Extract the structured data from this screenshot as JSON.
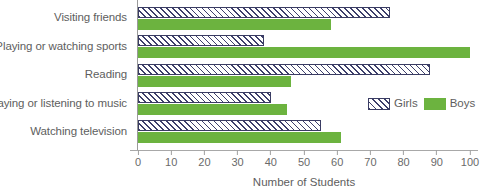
{
  "chart_data": {
    "type": "bar",
    "orientation": "horizontal",
    "title": "",
    "xlabel": "Number of Students",
    "ylabel": "",
    "xlim": [
      0,
      100
    ],
    "xticks": [
      0,
      10,
      20,
      30,
      40,
      50,
      60,
      70,
      80,
      90,
      100
    ],
    "xtick_labels": [
      "0",
      "10",
      "20",
      "30",
      "40",
      "50",
      "60",
      "70",
      "80",
      "90",
      "100"
    ],
    "grid": false,
    "legend_position": "center-right",
    "categories": [
      "Visiting friends",
      "Playing or watching sports",
      "Reading",
      "Playing or listening to music",
      "Watching television"
    ],
    "series": [
      {
        "name": "Girls",
        "pattern": "diagonal-hatch",
        "color": "#3d3f6b",
        "values": [
          76,
          38,
          88,
          40,
          55
        ]
      },
      {
        "name": "Boys",
        "pattern": "solid",
        "color": "#6cb33f",
        "values": [
          58,
          100,
          46,
          45,
          61
        ]
      }
    ]
  },
  "legend": {
    "items": [
      {
        "label": "Girls",
        "swatch": "hatched-swatch"
      },
      {
        "label": "Boys",
        "swatch": "green-swatch"
      }
    ]
  },
  "colors": {
    "boys_green": "#6cb33f",
    "girls_hatch": "#3d3f6b",
    "axis": "#a0a0a0",
    "text": "#5e5e5e"
  }
}
